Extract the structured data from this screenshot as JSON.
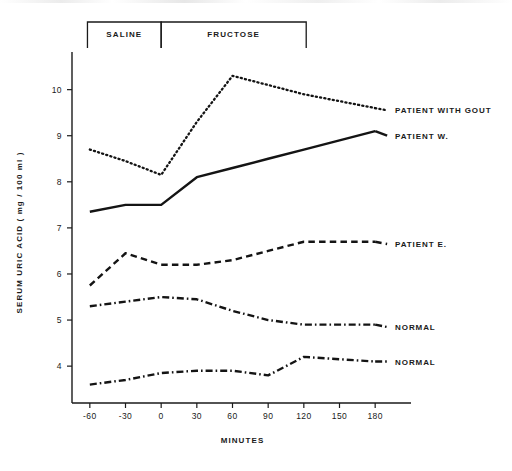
{
  "page": {
    "corner_note": ""
  },
  "chart_data": {
    "type": "line",
    "title": "",
    "xlabel": "MINUTES",
    "ylabel": "SERUM URIC ACID ( mg / 100 ml )",
    "x": [
      -60,
      -30,
      0,
      30,
      60,
      90,
      120,
      150,
      180
    ],
    "xticklabels": [
      "-60",
      "-30",
      "0",
      "30",
      "60",
      "90",
      "120",
      "150",
      "180"
    ],
    "xlim": [
      -75,
      195
    ],
    "ylim": [
      3.2,
      10.6
    ],
    "yticks": [
      4,
      5,
      6,
      7,
      8,
      9,
      10
    ],
    "yticklabels": [
      "4",
      "5",
      "6",
      "7",
      "8",
      "9",
      "10"
    ],
    "grid": false,
    "legend_position": "right-inline",
    "series": [
      {
        "name": "PATIENT WITH GOUT",
        "style": "dotted",
        "label_x": 185,
        "label_y": 9.55,
        "values": [
          8.7,
          8.45,
          8.15,
          9.3,
          10.3,
          10.1,
          9.9,
          9.75,
          9.6
        ]
      },
      {
        "name": "PATIENT W.",
        "style": "solid",
        "label_x": 185,
        "label_y": 9.0,
        "values": [
          7.35,
          7.5,
          7.5,
          8.1,
          8.3,
          8.5,
          8.7,
          8.9,
          9.1
        ]
      },
      {
        "name": "PATIENT E.",
        "style": "dashed",
        "label_x": 185,
        "label_y": 6.65,
        "values": [
          5.75,
          6.45,
          6.2,
          6.2,
          6.3,
          6.5,
          6.7,
          6.7,
          6.7
        ]
      },
      {
        "name": "NORMAL",
        "style": "dashdot",
        "label_x": 185,
        "label_y": 4.85,
        "values": [
          5.3,
          5.4,
          5.5,
          5.45,
          5.2,
          5.0,
          4.9,
          4.9,
          4.9
        ]
      },
      {
        "name": "NORMAL",
        "style": "dashdot",
        "label_x": 185,
        "label_y": 4.1,
        "values": [
          3.6,
          3.7,
          3.85,
          3.9,
          3.9,
          3.8,
          4.2,
          4.15,
          4.1
        ]
      }
    ],
    "annotations": [
      {
        "name": "SALINE",
        "x_start": -62,
        "x_end": 0
      },
      {
        "name": "FRUCTOSE",
        "x_start": 0,
        "x_end": 122
      }
    ]
  }
}
